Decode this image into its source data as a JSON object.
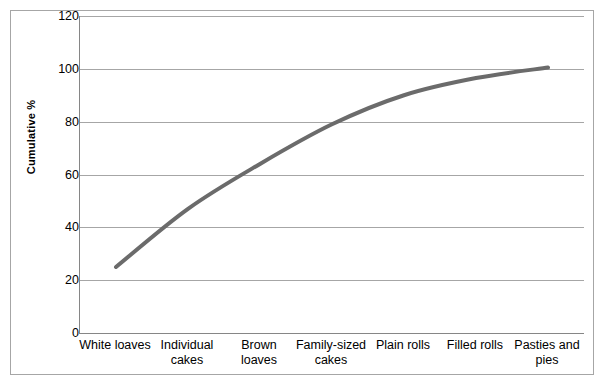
{
  "chart_data": {
    "type": "line",
    "title": "",
    "xlabel": "",
    "ylabel": "Cumulative %",
    "categories": [
      "White loaves",
      "Individual cakes",
      "Brown loaves",
      "Family-sized cakes",
      "Plain rolls",
      "Filled rolls",
      "Pasties and pies"
    ],
    "values": [
      25,
      47,
      64,
      79,
      90,
      96.5,
      100.5
    ],
    "ylim": [
      0,
      120
    ],
    "ytick_step": 20,
    "yticks": [
      "120",
      "100",
      "80",
      "60",
      "40",
      "20",
      "0"
    ],
    "ytick_values": [
      120,
      100,
      80,
      60,
      40,
      20,
      0
    ],
    "grid": "horizontal",
    "legend": "none",
    "series": [
      {
        "name": "Cumulative %",
        "values": [
          25,
          47,
          64,
          79,
          90,
          96.5,
          100.5
        ],
        "color": "#6b6b6b",
        "line_width": 4,
        "smooth": true
      }
    ]
  },
  "axis": {
    "y_title": "Cumulative %",
    "y_tick_labels": [
      "120",
      "100",
      "80",
      "60",
      "40",
      "20",
      "0"
    ],
    "x_tick_labels": [
      "White loaves",
      "Individual cakes",
      "Brown loaves",
      "Family-sized cakes",
      "Plain rolls",
      "Filled rolls",
      "Pasties and pies"
    ]
  },
  "colors": {
    "series_line": "#6b6b6b",
    "gridline": "#a6a6a6",
    "axis_line": "#868686",
    "frame_border": "#a6a6a6",
    "background": "#ffffff",
    "text": "#000000"
  }
}
